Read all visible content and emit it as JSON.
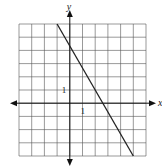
{
  "chart_data": {
    "type": "line",
    "title": "",
    "xlabel": "x",
    "ylabel": "y",
    "xlim": [
      -4,
      6
    ],
    "ylim": [
      -4,
      6
    ],
    "grid": true,
    "tick_labels": {
      "x": "1",
      "y": "1"
    },
    "series": [
      {
        "name": "line",
        "x": [
          -1,
          5
        ],
        "y": [
          6,
          -4
        ],
        "slope": -1.667,
        "y_intercept": 4.33,
        "x_intercept": 2.6
      }
    ],
    "colors": {
      "grid": "#555555",
      "axis": "#111111",
      "line": "#222222"
    }
  }
}
